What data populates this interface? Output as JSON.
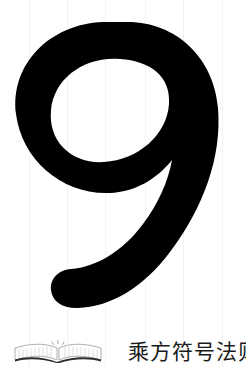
{
  "page": {
    "background_color": "#ffffff",
    "ink_color": "#000000",
    "scanline_color": "#f2f2f2",
    "width": 246,
    "height": 366
  },
  "chapter": {
    "number": "9",
    "number_color": "#000000",
    "title": "乘方符号法则",
    "title_color": "#1a1a1a"
  },
  "decorations": {
    "book_icon_name": "open-book-icon",
    "book_icon_color": "#6e6e6e",
    "scanline_positions": [
      29,
      67,
      105,
      145,
      183,
      222
    ]
  }
}
